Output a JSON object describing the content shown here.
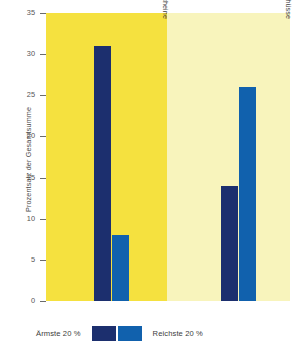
{
  "chart_data": {
    "type": "bar",
    "title": "",
    "xlabel": "",
    "ylabel": "Prozentsatz der Gesamtsumme",
    "ylim": [
      0,
      35
    ],
    "yticks": [
      0,
      5,
      10,
      15,
      20,
      25,
      30,
      35
    ],
    "ytick_labels": [
      "0",
      "5",
      "10",
      "15",
      "20",
      "25",
      "30",
      "35"
    ],
    "grid": false,
    "legend_position": "bottom",
    "categories": [
      "Lebensmittelgutscheine",
      "Lebensmittelzuschüsse"
    ],
    "series": [
      {
        "name": "Ärmste 20 %",
        "color": "#1c2f6e",
        "values": [
          31,
          14
        ]
      },
      {
        "name": "Reichste 20 %",
        "color": "#1161ad",
        "values": [
          8,
          26
        ]
      }
    ],
    "panels": [
      {
        "label": "Lebensmittelgutscheine",
        "background": "#f5e13f"
      },
      {
        "label": "Lebensmittelzuschüsse",
        "background": "#f8f4bc"
      }
    ]
  },
  "legend": {
    "left_label": "Ärmste 20 %",
    "right_label": "Reichste 20 %",
    "left_color": "#1c2f6e",
    "right_color": "#1161ad"
  },
  "axis": {
    "y_title": "Prozentsatz der Gesamtsumme"
  }
}
